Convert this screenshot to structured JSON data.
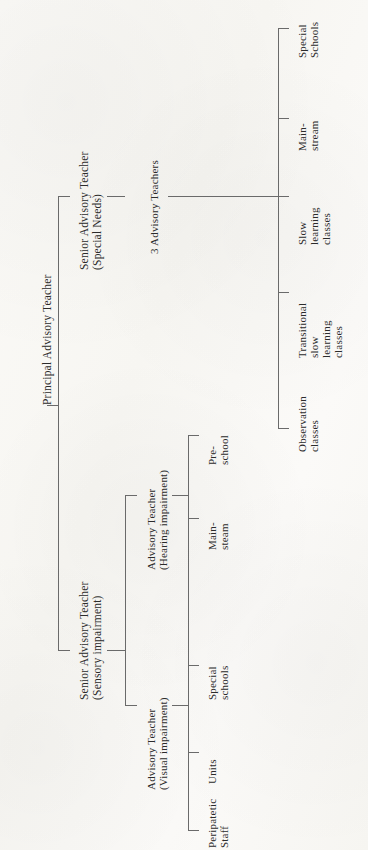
{
  "figure": {
    "type": "organization-chart",
    "orientation": "rotated-90-ccw",
    "background": "#fdfdfb",
    "line_color": "#6a6a6a",
    "text_color": "#2b2b2b"
  },
  "nodes": {
    "root": {
      "label": "Principal Advisory Teacher"
    },
    "special_needs": {
      "line1": "Senior Advisory Teacher",
      "line2": "(Special Needs)"
    },
    "three_advisory_teachers": {
      "label": "3 Advisory Teachers"
    },
    "sensory": {
      "line1": "Senior Advisory Teacher",
      "line2": "(Sensory impairment)"
    },
    "hearing": {
      "line1": "Advisory Teacher",
      "line2": "(Hearing impairment)"
    },
    "visual": {
      "line1": "Advisory Teacher",
      "line2": "(Visual impairment)"
    }
  },
  "leaves": {
    "special_needs_branch": [
      {
        "name": "special-schools",
        "line1": "Special",
        "line2": "Schools",
        "line3": ""
      },
      {
        "name": "mainstream",
        "line1": "Main-",
        "line2": "stream",
        "line3": ""
      },
      {
        "name": "slow-learning-classes",
        "line1": "Slow",
        "line2": "learning",
        "line3": "classes"
      },
      {
        "name": "transitional-slow-learning",
        "line1": "Transitional",
        "line2": "slow",
        "line3": "learning classes"
      },
      {
        "name": "observation-classes",
        "line1": "Observation",
        "line2": "classes",
        "line3": ""
      }
    ],
    "hearing_branch": [
      {
        "name": "pre-school",
        "line1": "Pre-",
        "line2": "school"
      },
      {
        "name": "main-steam",
        "line1": "Main-",
        "line2": "steam"
      },
      {
        "name": "special-schools",
        "line1": "Special",
        "line2": "schools"
      }
    ],
    "visual_branch": [
      {
        "name": "units",
        "line1": "Units",
        "line2": ""
      },
      {
        "name": "peripatetic-staff",
        "line1": "Peripatetic",
        "line2": "Staff"
      }
    ]
  },
  "extra_leaf_lines": {
    "transitional_l3": "learning",
    "transitional_l4": "classes"
  }
}
